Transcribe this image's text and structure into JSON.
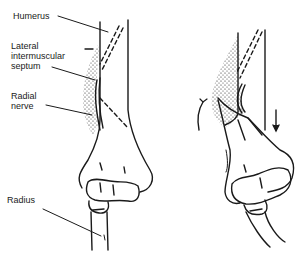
{
  "diagram": {
    "labels": [
      {
        "id": "humerus",
        "text": "Humerus",
        "x": 13,
        "y": 12
      },
      {
        "id": "septum",
        "text": "Lateral\nintermuscular\nseptum",
        "x": 11,
        "y": 42
      },
      {
        "id": "radial-nerve",
        "text": "Radial\nnerve",
        "x": 11,
        "y": 92
      },
      {
        "id": "radius",
        "text": "Radius",
        "x": 7,
        "y": 196
      }
    ],
    "figures": [
      {
        "id": "left",
        "description": "Elbow in neutral position, radial nerve passing through lateral intermuscular septum"
      },
      {
        "id": "right",
        "description": "Elbow with displaced fracture; arrows indicating rotation and downward displacement"
      }
    ],
    "colors": {
      "ink": "#1a1a1a",
      "background": "#ffffff"
    }
  }
}
